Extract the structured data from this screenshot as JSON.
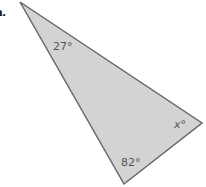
{
  "problem_label": "a.",
  "triangle": {
    "fill": "#d3d3d3",
    "stroke": "#666666",
    "angles": [
      {
        "vertex": "top",
        "label": "27°"
      },
      {
        "vertex": "bottom",
        "label": "82°"
      },
      {
        "vertex": "right",
        "label": "x°"
      }
    ]
  }
}
